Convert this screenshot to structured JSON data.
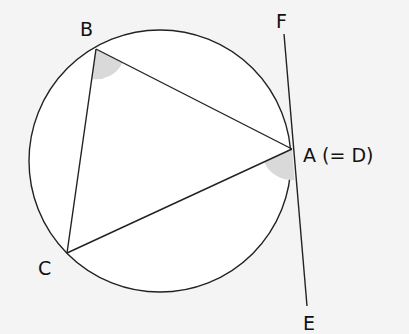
{
  "diagram": {
    "colors": {
      "background": "#f4f4f4",
      "circle_fill": "#ffffff",
      "stroke": "#222222",
      "shade": "#d9d9d9"
    },
    "circle": {
      "cx": 160,
      "cy": 161,
      "r": 131
    },
    "points": {
      "A": {
        "x": 292,
        "y": 149,
        "label": "A (= D)",
        "lx": 303,
        "ly": 162
      },
      "B": {
        "x": 96,
        "y": 49,
        "label": "B",
        "lx": 80,
        "ly": 36
      },
      "C": {
        "x": 67,
        "y": 253,
        "label": "C",
        "lx": 38,
        "ly": 275
      },
      "F": {
        "x": 284,
        "y": 34,
        "label": "F",
        "lx": 276,
        "ly": 28
      },
      "E": {
        "x": 307,
        "y": 306,
        "label": "E",
        "lx": 303,
        "ly": 330
      }
    },
    "shaded_angles": [
      "angle CBA at B",
      "angle between AC and tangent AE at A"
    ]
  }
}
